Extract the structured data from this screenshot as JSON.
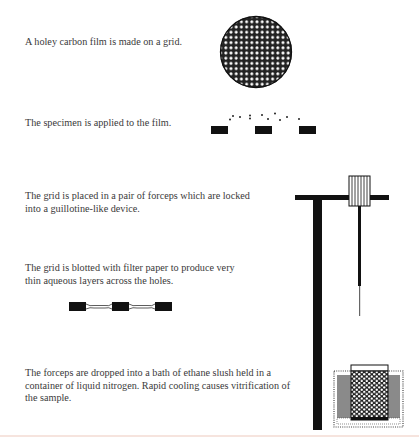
{
  "diagram": {
    "steps": [
      {
        "id": 1,
        "text": "A holey carbon film is made on a grid.",
        "figure": "holey-carbon-grid"
      },
      {
        "id": 2,
        "text": "The specimen is applied to the film.",
        "figure": "specimen-on-film"
      },
      {
        "id": 3,
        "text": "The grid is placed in a pair of forceps which are locked into a guillotine-like device.",
        "figure": "guillotine-forceps"
      },
      {
        "id": 4,
        "text": "The grid is blotted with filter paper to produce very thin aqueous layers across the holes.",
        "figure": "blotted-thin-layers"
      },
      {
        "id": 5,
        "text": "The forceps are dropped into a bath of ethane slush held in a container of liquid nitrogen. Rapid cooling causes vitrification of the sample.",
        "figure": "ethane-bath-in-liquid-nitrogen"
      }
    ],
    "colors": {
      "ink": "#111111",
      "text": "#3a3a3a",
      "nitrogen_fill": "#8a8a8a",
      "background": "#ffffff"
    }
  }
}
